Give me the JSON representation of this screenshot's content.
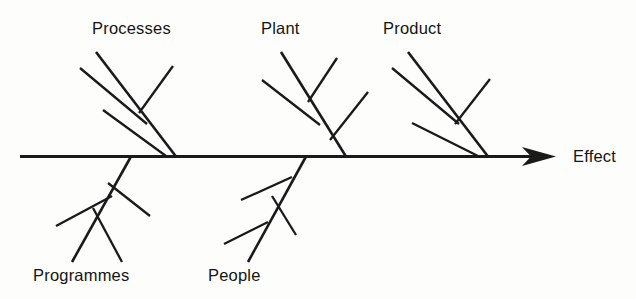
{
  "diagram": {
    "type": "fishbone-ishikawa-cause-and-effect",
    "orientation": "left-to-right",
    "background_color": "#fdfdfc",
    "line_color": "#1a1a1a",
    "effect": {
      "label": "Effect",
      "x": 573,
      "y": 162
    },
    "spine": {
      "x_start": 20,
      "x_end": 556,
      "y": 156,
      "has_arrow_head": true,
      "arrow_tip_x": 556
    },
    "categories": [
      {
        "id": "processes",
        "label": "Processes",
        "side": "top",
        "label_x": 92,
        "label_y": 34,
        "spine_junction_x": 176,
        "rib_start_x": 96,
        "rib_start_y": 52,
        "twig_count": 3
      },
      {
        "id": "plant",
        "label": "Plant",
        "side": "top",
        "label_x": 261,
        "label_y": 34,
        "spine_junction_x": 346,
        "rib_start_x": 281,
        "rib_start_y": 52,
        "twig_count": 3
      },
      {
        "id": "product",
        "label": "Product",
        "side": "top",
        "label_x": 383,
        "label_y": 34,
        "spine_junction_x": 488,
        "rib_start_x": 408,
        "rib_start_y": 52,
        "twig_count": 3
      },
      {
        "id": "programmes",
        "label": "Programmes",
        "side": "bottom",
        "label_x": 33,
        "label_y": 281,
        "spine_junction_x": 131,
        "rib_end_x": 72,
        "rib_end_y": 262,
        "twig_count": 3
      },
      {
        "id": "people",
        "label": "People",
        "side": "bottom",
        "label_x": 208,
        "label_y": 281,
        "spine_junction_x": 306,
        "rib_end_x": 248,
        "rib_end_y": 262,
        "twig_count": 3
      }
    ]
  }
}
